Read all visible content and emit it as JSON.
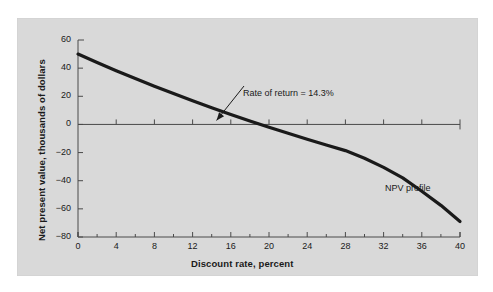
{
  "chart_data": {
    "type": "line",
    "title": "",
    "xlabel": "Discount rate, percent",
    "ylabel": "Net present value, thousands of dollars",
    "xlim": [
      0,
      40
    ],
    "ylim": [
      -80,
      60
    ],
    "grid": false,
    "legend_position": "inline-label",
    "xticks": [
      "0",
      "4",
      "8",
      "12",
      "16",
      "20",
      "24",
      "28",
      "32",
      "36",
      "40"
    ],
    "xtick_values": [
      0,
      4,
      8,
      12,
      16,
      20,
      24,
      28,
      32,
      36,
      40
    ],
    "xminor_values": [
      2,
      6,
      10,
      14,
      18,
      22,
      26,
      30,
      34,
      38
    ],
    "yticks": [
      "60",
      "40",
      "20",
      "0",
      "−20",
      "−40",
      "−60",
      "−80"
    ],
    "ytick_values": [
      60,
      40,
      20,
      0,
      -20,
      -40,
      -60,
      -80
    ],
    "series": [
      {
        "name": "NPV profile",
        "label": "NPV profile",
        "color": "#1a1a1a",
        "x": [
          0,
          2,
          4,
          6,
          8,
          10,
          12,
          14,
          16,
          18,
          20,
          22,
          24,
          26,
          28,
          30,
          32,
          34,
          36,
          38,
          40
        ],
        "values": [
          50.0,
          44.0,
          38.2,
          32.6,
          27.2,
          21.9,
          16.8,
          11.9,
          7.1,
          2.5,
          -2.0,
          -6.3,
          -10.5,
          -14.6,
          -18.6,
          -24.0,
          -30.5,
          -38.0,
          -47.5,
          -57.5,
          -69.0
        ]
      }
    ],
    "annotations": [
      {
        "name": "rate-of-return",
        "text": "Rate of return = 14.3%",
        "value": 14.3,
        "point_x": 14.3,
        "point_y": 0
      }
    ]
  },
  "colors": {
    "panel_background": "#d9d9d9",
    "figure_background": "#ffffff",
    "axis": "#4a4a4a",
    "curve": "#1a1a1a",
    "text": "#1a1a1a"
  }
}
